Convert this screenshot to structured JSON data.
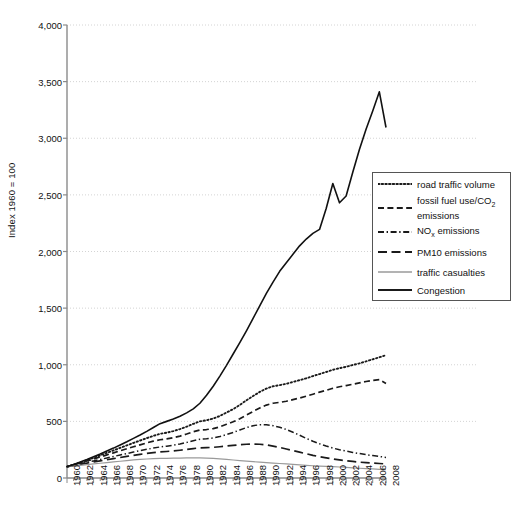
{
  "chart_data": {
    "type": "line",
    "title": "",
    "xlabel": "",
    "ylabel": "Index 1960 = 100",
    "xlim": [
      1960,
      2008
    ],
    "ylim": [
      0,
      4000
    ],
    "ytick_labels": [
      "0",
      "500",
      "1,000",
      "1,500",
      "2,000",
      "2,500",
      "3,000",
      "3,500",
      "4,000"
    ],
    "ytick_values": [
      0,
      500,
      1000,
      1500,
      2000,
      2500,
      3000,
      3500,
      4000
    ],
    "xtick_labels": [
      "1960",
      "1962",
      "1964",
      "1966",
      "1968",
      "1970",
      "1972",
      "1974",
      "1976",
      "1978",
      "1980",
      "1982",
      "1984",
      "1986",
      "1988",
      "1990",
      "1992",
      "1994",
      "1996",
      "1998",
      "2000",
      "2002",
      "2004",
      "2006",
      "2008"
    ],
    "xtick_values": [
      1960,
      1962,
      1964,
      1966,
      1968,
      1970,
      1972,
      1974,
      1976,
      1978,
      1980,
      1982,
      1984,
      1986,
      1988,
      1990,
      1992,
      1994,
      1996,
      1998,
      2000,
      2002,
      2004,
      2006,
      2008
    ],
    "minor_ticks_every": 1,
    "grid": "horizontal-dotted",
    "legend_position": "right-middle",
    "x": [
      1960,
      1961,
      1962,
      1963,
      1964,
      1965,
      1966,
      1967,
      1968,
      1969,
      1970,
      1971,
      1972,
      1973,
      1974,
      1975,
      1976,
      1977,
      1978,
      1979,
      1980,
      1981,
      1982,
      1983,
      1984,
      1985,
      1986,
      1987,
      1988,
      1989,
      1990,
      1991,
      1992,
      1993,
      1994,
      1995,
      1996,
      1997,
      1998,
      1999,
      2000,
      2001,
      2002,
      2003,
      2004,
      2005,
      2006,
      2007,
      2008
    ],
    "series": [
      {
        "name": "road traffic volume",
        "style": "dotted",
        "color": "#1a1a1a",
        "values": [
          100,
          118,
          137,
          157,
          178,
          200,
          222,
          244,
          266,
          288,
          310,
          331,
          352,
          372,
          390,
          400,
          414,
          432,
          453,
          478,
          500,
          510,
          525,
          548,
          578,
          608,
          645,
          686,
          724,
          760,
          790,
          810,
          820,
          832,
          848,
          864,
          880,
          900,
          918,
          936,
          955,
          970,
          982,
          998,
          1012,
          1030,
          1048,
          1066,
          1085
        ]
      },
      {
        "name": "fossil fuel use/CO2 emissions",
        "style": "dashed",
        "color": "#1a1a1a",
        "values": [
          100,
          116,
          133,
          150,
          168,
          186,
          204,
          222,
          240,
          258,
          276,
          293,
          310,
          326,
          338,
          345,
          356,
          370,
          388,
          408,
          424,
          428,
          436,
          452,
          474,
          496,
          524,
          556,
          588,
          618,
          644,
          660,
          668,
          678,
          692,
          706,
          722,
          740,
          758,
          774,
          792,
          806,
          816,
          828,
          840,
          852,
          862,
          868,
          835
        ]
      },
      {
        "name": "NOx emissions",
        "style": "dashdot",
        "color": "#1a1a1a",
        "values": [
          100,
          112,
          125,
          138,
          151,
          164,
          177,
          190,
          203,
          216,
          229,
          241,
          253,
          264,
          274,
          281,
          290,
          301,
          314,
          329,
          342,
          346,
          353,
          366,
          384,
          402,
          424,
          445,
          462,
          470,
          470,
          462,
          448,
          428,
          404,
          378,
          350,
          325,
          302,
          282,
          264,
          250,
          238,
          226,
          216,
          206,
          198,
          190,
          182
        ]
      },
      {
        "name": "PM10 emissions",
        "style": "longdash",
        "color": "#1a1a1a",
        "values": [
          100,
          110,
          120,
          131,
          141,
          151,
          161,
          171,
          181,
          191,
          200,
          209,
          217,
          224,
          230,
          234,
          239,
          245,
          252,
          260,
          266,
          268,
          271,
          276,
          282,
          288,
          294,
          298,
          300,
          298,
          292,
          282,
          270,
          256,
          242,
          228,
          214,
          200,
          188,
          178,
          168,
          160,
          152,
          146,
          140,
          136,
          132,
          128,
          124
        ]
      },
      {
        "name": "traffic casualties",
        "style": "solid-thin",
        "color": "#9a9a9a",
        "values": [
          100,
          106,
          112,
          118,
          124,
          130,
          136,
          142,
          148,
          154,
          160,
          164,
          168,
          171,
          173,
          174,
          175,
          176,
          177,
          178,
          178,
          176,
          173,
          169,
          164,
          159,
          154,
          149,
          144,
          140,
          136,
          132,
          128,
          124,
          120,
          116,
          112,
          108,
          105,
          102,
          100,
          97,
          94,
          90,
          86,
          83,
          80,
          77,
          74
        ]
      },
      {
        "name": "Congestion",
        "style": "solid",
        "color": "#111111",
        "values": [
          100,
          120,
          142,
          164,
          188,
          212,
          238,
          264,
          292,
          320,
          350,
          380,
          412,
          446,
          480,
          500,
          520,
          545,
          575,
          610,
          660,
          730,
          810,
          900,
          995,
          1095,
          1195,
          1300,
          1410,
          1520,
          1630,
          1730,
          1825,
          1900,
          1975,
          2050,
          2110,
          2160,
          2195,
          2380,
          2600,
          2430,
          2490,
          2700,
          2900,
          3080,
          3240,
          3410,
          3095
        ]
      }
    ]
  },
  "axes": {
    "y_title": "Index 1960 = 100"
  },
  "legend": {
    "entries": [
      {
        "label": "road traffic volume",
        "label2": "",
        "style": "dotted"
      },
      {
        "label": "fossil fuel use/CO",
        "sub": "2",
        "label2": "emissions",
        "style": "dashed"
      },
      {
        "label": "NO",
        "sub": "x",
        "label2": " emissions",
        "style": "dashdot"
      },
      {
        "label": "PM10 emissions",
        "label2": "",
        "style": "longdash"
      },
      {
        "label": "traffic casualties",
        "label2": "",
        "style": "solid-thin"
      },
      {
        "label": "Congestion",
        "label2": "",
        "style": "solid"
      }
    ]
  }
}
